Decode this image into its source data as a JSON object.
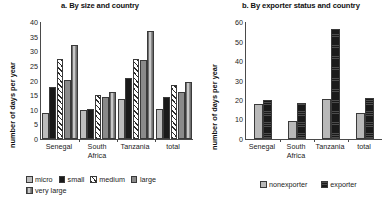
{
  "chart_data": [
    {
      "type": "bar",
      "panel": "a",
      "title": "a. By size and country",
      "xlabel": "",
      "ylabel": "number of days per year",
      "categories": [
        "Senegal",
        "South Africa",
        "Tanzania",
        "total"
      ],
      "category_lines": [
        [
          "Senegal"
        ],
        [
          "South",
          "Africa"
        ],
        [
          "Tanzania"
        ],
        [
          "total"
        ]
      ],
      "ylim": [
        0,
        40
      ],
      "yticks": [
        0,
        5,
        10,
        15,
        20,
        25,
        30,
        35,
        40
      ],
      "grid": false,
      "legend_position": "bottom",
      "series": [
        {
          "name": "micro",
          "pattern": "solid-light-gray",
          "color": "#bdbdbd",
          "values": [
            8.8,
            9.9,
            13.8,
            10.1
          ]
        },
        {
          "name": "small",
          "pattern": "solid-black",
          "color": "#1a1a1a",
          "values": [
            17.8,
            10.2,
            21.0,
            14.5
          ]
        },
        {
          "name": "medium",
          "pattern": "diagonal-hatch",
          "color": "#ffffff",
          "values": [
            27.2,
            15.0,
            27.2,
            18.6
          ]
        },
        {
          "name": "large",
          "pattern": "solid-mid-gray",
          "color": "#8a8a8a",
          "values": [
            20.3,
            14.2,
            27.0,
            16.1
          ]
        },
        {
          "name": "very large",
          "pattern": "vertical-stripes",
          "color": "#9a9a9a",
          "values": [
            32.0,
            16.1,
            36.8,
            19.5
          ]
        }
      ]
    },
    {
      "type": "bar",
      "panel": "b",
      "title": "b. By exporter status and country",
      "xlabel": "",
      "ylabel": "number of days per year",
      "categories": [
        "Senegal",
        "South Africa",
        "Tanzania",
        "total"
      ],
      "category_lines": [
        [
          "Senegal"
        ],
        [
          "South",
          "Africa"
        ],
        [
          "Tanzania"
        ],
        [
          "total"
        ]
      ],
      "ylim": [
        0,
        60
      ],
      "yticks": [
        0,
        10,
        20,
        30,
        40,
        50,
        60
      ],
      "grid": false,
      "legend_position": "bottom",
      "series": [
        {
          "name": "nonexporter",
          "pattern": "solid-light-gray",
          "color": "#b9b9b9",
          "values": [
            17.9,
            9.4,
            20.6,
            13.5
          ]
        },
        {
          "name": "exporter",
          "pattern": "solid-black",
          "color": "#1a1a1a",
          "values": [
            20.2,
            18.3,
            56.5,
            21.0
          ]
        }
      ]
    }
  ]
}
